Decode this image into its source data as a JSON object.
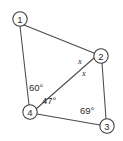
{
  "diagram": {
    "type": "geometry-figure",
    "background_color": "#ffffff",
    "line_color": "#4a4a4a",
    "text_color": "#2a2a2a",
    "vertices": [
      {
        "id": "v1",
        "label": "1",
        "cx": 20,
        "cy": 19,
        "r": 7.2
      },
      {
        "id": "v2",
        "label": "2",
        "cx": 101,
        "cy": 56,
        "r": 7.2
      },
      {
        "id": "v3",
        "label": "3",
        "cx": 107,
        "cy": 126,
        "r": 7.2
      },
      {
        "id": "v4",
        "label": "4",
        "cx": 30,
        "cy": 112,
        "r": 7.2
      }
    ],
    "edges": [
      {
        "id": "e-1-2",
        "from": "1",
        "to": "2",
        "x1": 24,
        "y1": 25,
        "x2": 94,
        "y2": 53
      },
      {
        "id": "e-1-4",
        "from": "1",
        "to": "4",
        "x1": 20,
        "y1": 26,
        "x2": 29,
        "y2": 105
      },
      {
        "id": "e-4-2",
        "from": "4",
        "to": "2",
        "x1": 36,
        "y1": 109,
        "x2": 94,
        "y2": 58
      },
      {
        "id": "e-2-3",
        "from": "2",
        "to": "3",
        "x1": 102,
        "y1": 63,
        "x2": 106,
        "y2": 119
      },
      {
        "id": "e-4-3",
        "from": "4",
        "to": "3",
        "x1": 37,
        "y1": 114,
        "x2": 100,
        "y2": 125
      }
    ],
    "angle_labels": [
      {
        "id": "angle-60",
        "text": "60°",
        "at_vertex": "4",
        "x": 29,
        "y": 87
      },
      {
        "id": "angle-47",
        "text": "47°",
        "at_vertex": "4",
        "x": 42,
        "y": 100
      },
      {
        "id": "angle-69",
        "text": "69°",
        "at_vertex": "3",
        "x": 80,
        "y": 110
      }
    ],
    "variable_labels": [
      {
        "id": "var-x-upper",
        "text": "x",
        "at_vertex": "2",
        "x": 80,
        "y": 61
      },
      {
        "id": "var-x-lower",
        "text": "x",
        "at_vertex": "2",
        "x": 84,
        "y": 73
      }
    ]
  }
}
